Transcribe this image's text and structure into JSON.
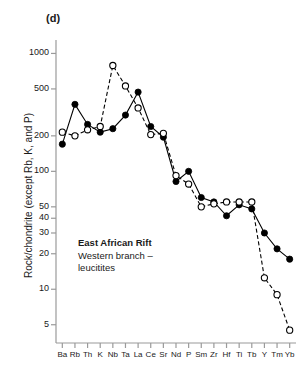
{
  "panel": {
    "label": "(d)"
  },
  "annotation": {
    "title": "East African Rift",
    "line1": "Western branch –",
    "line2": "leucitites"
  },
  "axis": {
    "y_title": "Rock/chondrite (except Rb, K, and P)"
  },
  "chart_data": {
    "type": "line",
    "title": "(d)",
    "xlabel": "",
    "ylabel": "Rock/chondrite (except Rb, K, and P)",
    "yscale": "log",
    "ylim": [
      3.5,
      1300
    ],
    "ytick_values": [
      1000,
      500,
      200,
      100,
      50,
      40,
      30,
      20,
      10,
      5
    ],
    "ytick_labels": [
      "1000",
      "500",
      "200",
      "100",
      "50",
      "40",
      "30",
      "20",
      "10",
      "5"
    ],
    "grid": false,
    "legend_position": "inside-annotation",
    "categories": [
      "Ba",
      "Rb",
      "Th",
      "K",
      "Nb",
      "Ta",
      "La",
      "Ce",
      "Sr",
      "Nd",
      "P",
      "Sm",
      "Zr",
      "Hf",
      "Ti",
      "Tb",
      "Y",
      "Tm",
      "Yb"
    ],
    "series": [
      {
        "name": "filled-circles",
        "marker": "filled-circle",
        "linestyle": "solid",
        "color": "#000000",
        "values": [
          170,
          370,
          250,
          215,
          230,
          300,
          470,
          240,
          195,
          82,
          100,
          60,
          55,
          42,
          52,
          48,
          30,
          22,
          18
        ]
      },
      {
        "name": "open-circles",
        "marker": "open-circle",
        "linestyle": "dashed",
        "color": "#000000",
        "values": [
          215,
          200,
          225,
          240,
          790,
          530,
          345,
          205,
          210,
          92,
          78,
          50,
          53,
          55,
          55,
          55,
          12.5,
          9,
          4.5
        ]
      }
    ]
  }
}
